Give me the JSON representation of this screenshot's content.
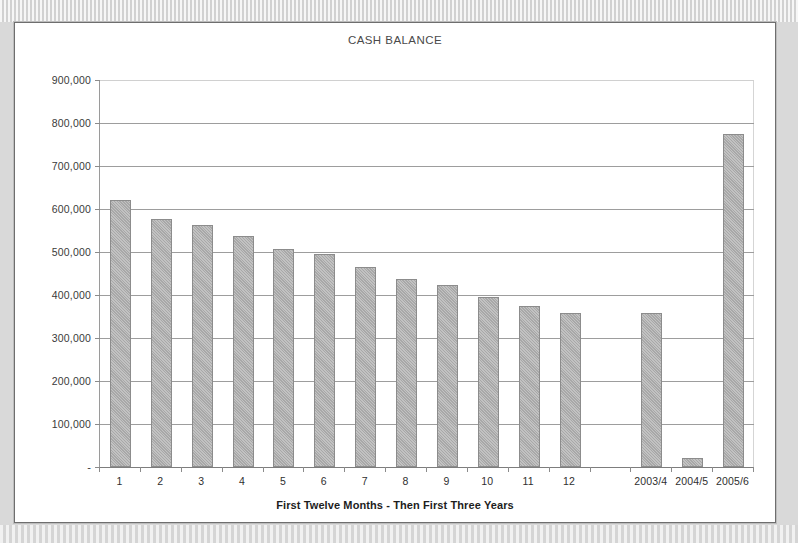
{
  "chart_data": {
    "type": "bar",
    "title": "CASH BALANCE",
    "xlabel": "First Twelve Months  -  Then First Three Years",
    "ylabel": "",
    "ylim": [
      0,
      900000
    ],
    "ytick_labels": [
      "900,000",
      "800,000",
      "700,000",
      "600,000",
      "500,000",
      "400,000",
      "300,000",
      "200,000",
      "100,000",
      "-"
    ],
    "ytick_values": [
      900000,
      800000,
      700000,
      600000,
      500000,
      400000,
      300000,
      200000,
      100000,
      0
    ],
    "grid": true,
    "legend": false,
    "categories": [
      "1",
      "2",
      "3",
      "4",
      "5",
      "6",
      "7",
      "8",
      "9",
      "10",
      "11",
      "12",
      "",
      "2003/4",
      "2004/5",
      "2005/6"
    ],
    "values": [
      622000,
      577000,
      563000,
      537000,
      508000,
      495000,
      465000,
      438000,
      423000,
      395000,
      374000,
      359000,
      null,
      359000,
      20000,
      775000
    ],
    "bar_color": "#a8a8a8",
    "bar_border_color": "#8c8c8c"
  },
  "page": {
    "background_color": "#d9d9d9",
    "card_background": "#ffffff",
    "card_border_color": "#6e6e6e"
  }
}
